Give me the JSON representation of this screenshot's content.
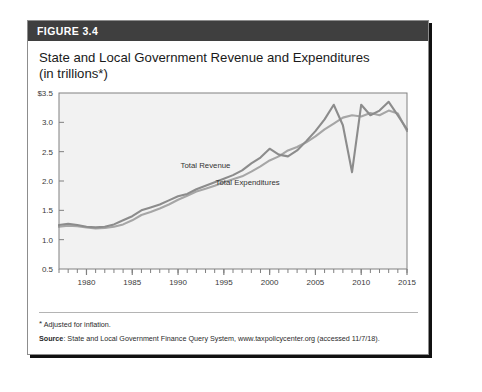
{
  "figure": {
    "number_label": "FIGURE 3.4",
    "title_line1": "State and Local Government Revenue and Expenditures",
    "title_line2": "(in trillions*)",
    "footnote": "Adjusted for inflation.",
    "footnote_marker": "*",
    "source_label": "Source",
    "source_text": ": State and Local Government Finance Query System, www.taxpolicycenter.org (accessed 11/7/18)."
  },
  "colors": {
    "header_bar": "#3f3f3f",
    "header_text": "#ffffff",
    "revenue_line": "#8c8c8c",
    "expenditures_line": "#a6a6a6",
    "plot_bg": "#f2f2f2",
    "plot_border": "#808080",
    "axis_text": "#3a3a3a"
  },
  "chart_data": {
    "type": "line",
    "title": "State and Local Government Revenue and Expenditures (in trillions*)",
    "xlabel": "",
    "ylabel": "",
    "xlim": [
      1977,
      2015
    ],
    "ylim": [
      0.5,
      3.5
    ],
    "yticks": [
      0.5,
      1.0,
      1.5,
      2.0,
      2.5,
      3.0,
      3.5
    ],
    "ytick_labels": [
      "0.5",
      "1.0",
      "1.5",
      "2.0",
      "2.5",
      "3.0",
      "$3.5"
    ],
    "xticks": [
      1980,
      1985,
      1990,
      1995,
      2000,
      2005,
      2010,
      2015
    ],
    "xtick_labels": [
      "1980",
      "1985",
      "1990",
      "1995",
      "2000",
      "2005",
      "2010",
      "2015"
    ],
    "minor_xticks_interval": 1,
    "grid": false,
    "legend": "inline-annotations",
    "annotations": [
      {
        "text": "Total Revenue",
        "x": 1993.0,
        "y": 2.22
      },
      {
        "text": "Total Expenditures",
        "x": 1997.6,
        "y": 1.93
      }
    ],
    "x": [
      1977,
      1978,
      1979,
      1980,
      1981,
      1982,
      1983,
      1984,
      1985,
      1986,
      1987,
      1988,
      1989,
      1990,
      1991,
      1992,
      1993,
      1994,
      1995,
      1996,
      1997,
      1998,
      1999,
      2000,
      2001,
      2002,
      2003,
      2004,
      2005,
      2006,
      2007,
      2008,
      2009,
      2010,
      2011,
      2012,
      2013,
      2014,
      2015
    ],
    "series": [
      {
        "name": "Total Revenue",
        "values": [
          1.25,
          1.27,
          1.25,
          1.22,
          1.21,
          1.22,
          1.26,
          1.33,
          1.4,
          1.5,
          1.55,
          1.6,
          1.67,
          1.74,
          1.78,
          1.86,
          1.92,
          1.98,
          2.04,
          2.1,
          2.18,
          2.3,
          2.4,
          2.55,
          2.45,
          2.42,
          2.52,
          2.68,
          2.85,
          3.05,
          3.3,
          2.95,
          2.15,
          3.3,
          3.12,
          3.2,
          3.35,
          3.12,
          2.88
        ]
      },
      {
        "name": "Total Expenditures",
        "values": [
          1.22,
          1.24,
          1.23,
          1.21,
          1.19,
          1.2,
          1.22,
          1.26,
          1.33,
          1.42,
          1.47,
          1.53,
          1.6,
          1.68,
          1.75,
          1.82,
          1.87,
          1.92,
          1.98,
          2.03,
          2.08,
          2.16,
          2.25,
          2.35,
          2.42,
          2.52,
          2.58,
          2.66,
          2.76,
          2.88,
          2.98,
          3.08,
          3.12,
          3.1,
          3.16,
          3.12,
          3.2,
          3.15,
          2.85
        ]
      }
    ]
  }
}
